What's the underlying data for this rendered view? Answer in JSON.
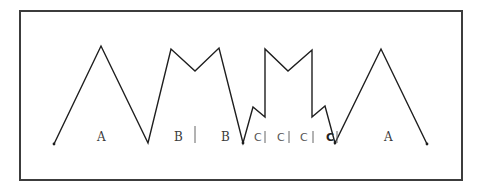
{
  "figure": {
    "frame": {
      "x": 20,
      "y": 11,
      "width": 442,
      "height": 169,
      "stroke": "#3c3c3c"
    },
    "outline_color": "#1e1e1e",
    "outline_points": [
      [
        54,
        144
      ],
      [
        101,
        46
      ],
      [
        148,
        143
      ],
      [
        171,
        49
      ],
      [
        195,
        71
      ],
      [
        219,
        48
      ],
      [
        243,
        143
      ],
      [
        253,
        107
      ],
      [
        265,
        117
      ],
      [
        265,
        49
      ],
      [
        288,
        71
      ],
      [
        312,
        50
      ],
      [
        312,
        117
      ],
      [
        325,
        106
      ],
      [
        335,
        143
      ],
      [
        381,
        49
      ],
      [
        427,
        144
      ]
    ],
    "segments": [
      {
        "label": "A",
        "x": 97,
        "y": 141,
        "style": "serif"
      },
      {
        "label": "B",
        "x": 174,
        "y": 141,
        "style": "serif"
      },
      {
        "label": "B",
        "x": 221,
        "y": 141,
        "style": "serif"
      },
      {
        "label": "C",
        "x": 254,
        "y": 141,
        "style": "sans"
      },
      {
        "label": "C",
        "x": 277,
        "y": 141,
        "style": "sans"
      },
      {
        "label": "C",
        "x": 300,
        "y": 141,
        "style": "sans"
      },
      {
        "label": "C",
        "x": 326,
        "y": 141,
        "style": "bold"
      },
      {
        "label": "A",
        "x": 384,
        "y": 141,
        "style": "serif"
      }
    ],
    "dividers": [
      {
        "x": 195,
        "y1": 126,
        "y2": 143
      },
      {
        "x": 265,
        "y1": 131,
        "y2": 143
      },
      {
        "x": 289,
        "y1": 131,
        "y2": 143
      },
      {
        "x": 313,
        "y1": 131,
        "y2": 143
      },
      {
        "x": 337,
        "y1": 131,
        "y2": 143
      }
    ]
  }
}
